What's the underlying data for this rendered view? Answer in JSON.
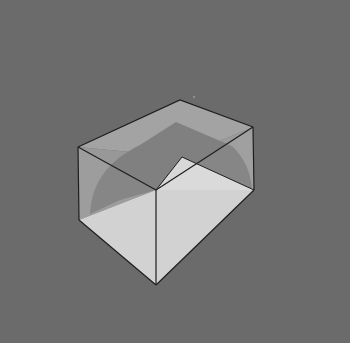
{
  "figure": {
    "title": "Transparent rectangular box in perspective",
    "colors": {
      "background": "#6b6b6b",
      "glass_wall": "#9a9a9a",
      "shadow_band": "#7d7d7d",
      "floor_light": "#d3d3d3",
      "floor_near": "#cbcbcb",
      "edge": "#1e1e1e"
    }
  }
}
